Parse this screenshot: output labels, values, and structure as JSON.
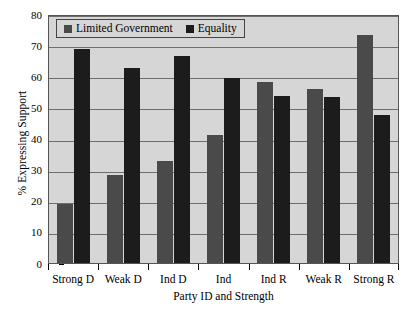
{
  "chart_data": {
    "type": "bar",
    "title": "",
    "xlabel": "Party ID and Strength",
    "ylabel": "% Expressing Support",
    "categories": [
      "Strong D",
      "Weak D",
      "Ind D",
      "Ind",
      "Ind R",
      "Weak R",
      "Strong R"
    ],
    "series": [
      {
        "name": "Limited Government",
        "color": "#4a4a4a",
        "values": [
          19,
          28.3,
          32.7,
          41,
          58.2,
          55.8,
          73.2
        ]
      },
      {
        "name": "Equality",
        "color": "#1c1c1c",
        "values": [
          68.8,
          62.7,
          66.5,
          59.5,
          53.6,
          53.3,
          47.4
        ]
      }
    ],
    "ylim": [
      0,
      80
    ],
    "yticks": [
      0,
      10,
      20,
      30,
      40,
      50,
      60,
      70,
      80
    ],
    "ytick_labels": [
      "0",
      "10",
      "20",
      "30",
      "40",
      "50",
      "60",
      "70",
      "80"
    ],
    "grid": true,
    "legend_position": "top-left",
    "plot_background": "#d6d6d6",
    "figure_background": "#ffffff"
  }
}
